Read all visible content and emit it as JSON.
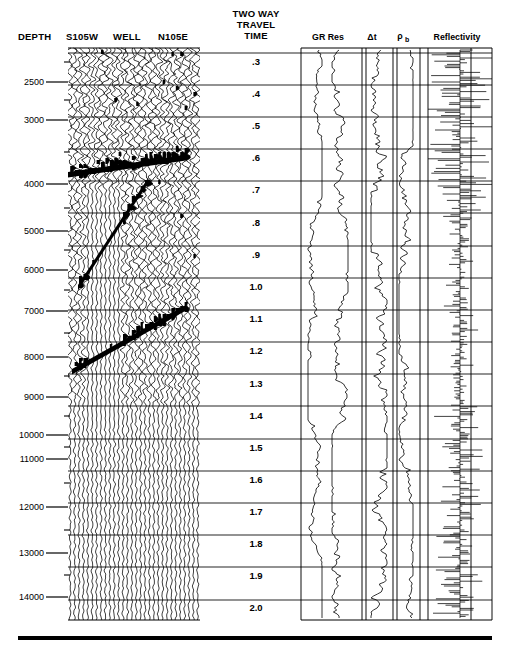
{
  "figure": {
    "type": "seismic-well-tie-display",
    "width": 509,
    "height": 655
  },
  "headers": {
    "depth": "DEPTH",
    "azimuth_left": "S105W",
    "well": "WELL",
    "azimuth_right": "N105E",
    "twt_line1": "TWO WAY",
    "twt_line2": "TRAVEL",
    "twt_line3": "TIME"
  },
  "tracks": [
    {
      "name": "gr-res",
      "label": "GR Res",
      "label_x": 328,
      "x0": 301,
      "x1": 362,
      "curves": 2
    },
    {
      "name": "delta-t",
      "label": "Δt",
      "label_x": 372,
      "x0": 366,
      "x1": 393,
      "curves": 1
    },
    {
      "name": "rho-b",
      "label": "ρ",
      "sub": "b",
      "label_x": 401,
      "x0": 393,
      "x1": 420,
      "curves": 1
    },
    {
      "name": "reflectivity",
      "label": "Reflectivity",
      "label_x": 457,
      "x0": 428,
      "x1": 492,
      "curves": 1
    }
  ],
  "depth_axis": {
    "unit": "ft",
    "label_x": 44,
    "tick_x0": 46,
    "tick_x1": 68,
    "ticks": [
      {
        "label": "2500",
        "y": 82
      },
      {
        "label": "3000",
        "y": 120
      },
      {
        "label": "4000",
        "y": 184
      },
      {
        "label": "5000",
        "y": 231
      },
      {
        "label": "6000",
        "y": 270
      },
      {
        "label": "7000",
        "y": 311
      },
      {
        "label": "8000",
        "y": 357
      },
      {
        "label": "9000",
        "y": 397
      },
      {
        "label": "10000",
        "y": 435
      },
      {
        "label": "11000",
        "y": 459
      },
      {
        "label": "12000",
        "y": 507
      },
      {
        "label": "13000",
        "y": 553
      },
      {
        "label": "14000",
        "y": 597
      }
    ]
  },
  "twt_axis": {
    "unit": "s",
    "label_x": 256,
    "line_x0": 68,
    "line_x1": 492,
    "gridlines": [
      {
        "label": ".3",
        "y_line": 53,
        "y_text": 65
      },
      {
        "label": ".4",
        "y_line": 85,
        "y_text": 97
      },
      {
        "label": ".5",
        "y_line": 117,
        "y_text": 129
      },
      {
        "label": ".6",
        "y_line": 149,
        "y_text": 161
      },
      {
        "label": ".7",
        "y_line": 181,
        "y_text": 193
      },
      {
        "label": ".8",
        "y_line": 213,
        "y_text": 226
      },
      {
        "label": ".9",
        "y_line": 246,
        "y_text": 258
      },
      {
        "label": "1.0",
        "y_line": 278,
        "y_text": 290
      },
      {
        "label": "1.1",
        "y_line": 310,
        "y_text": 322
      },
      {
        "label": "1.2",
        "y_line": 342,
        "y_text": 354
      },
      {
        "label": "1.3",
        "y_line": 374,
        "y_text": 387
      },
      {
        "label": "1.4",
        "y_line": 406,
        "y_text": 419
      },
      {
        "label": "1.5",
        "y_line": 439,
        "y_text": 451
      },
      {
        "label": "1.6",
        "y_line": 471,
        "y_text": 483
      },
      {
        "label": "1.7",
        "y_line": 503,
        "y_text": 515
      },
      {
        "label": "1.8",
        "y_line": 535,
        "y_text": 547
      },
      {
        "label": "1.9",
        "y_line": 567,
        "y_text": 579
      },
      {
        "label": "2.0",
        "y_line": 600,
        "y_text": 611
      }
    ]
  },
  "seismic_panel": {
    "x0": 68,
    "x1": 200,
    "y0": 48,
    "y1": 620,
    "trace_count": 30,
    "reflectors": [
      {
        "name": "dipping-reflector-upper",
        "x0": 68,
        "y0": 172,
        "x1": 186,
        "y1": 155
      },
      {
        "name": "dipping-reflector-lower",
        "x0": 72,
        "y0": 369,
        "x1": 186,
        "y1": 305
      },
      {
        "name": "fault-plane",
        "x0": 78,
        "y0": 285,
        "x1": 148,
        "y1": 178
      }
    ]
  },
  "baseline_bar": {
    "x0": 18,
    "x1": 492,
    "y": 638,
    "thickness": 4
  },
  "colors": {
    "ink": "#000000",
    "paper": "#ffffff",
    "grid": "#1a1a1a"
  },
  "chart_data": {
    "type": "line",
    "xlabel": "",
    "ylabel": "TWO WAY TRAVEL TIME",
    "grid": true,
    "legend": "none",
    "y_axis_primary": {
      "name": "TWO WAY TRAVEL TIME",
      "unit": "s",
      "range": [
        0.3,
        2.0
      ],
      "ticks": [
        0.3,
        0.4,
        0.5,
        0.6,
        0.7,
        0.8,
        0.9,
        1.0,
        1.1,
        1.2,
        1.3,
        1.4,
        1.5,
        1.6,
        1.7,
        1.8,
        1.9,
        2.0
      ]
    },
    "y_axis_secondary": {
      "name": "DEPTH",
      "unit": "ft",
      "range": [
        2500,
        14000
      ],
      "ticks": [
        2500,
        3000,
        4000,
        5000,
        6000,
        7000,
        8000,
        9000,
        10000,
        11000,
        12000,
        13000,
        14000
      ]
    },
    "series": [
      {
        "name": "GR Res",
        "kind": "well-log-curve",
        "track": "gr-res",
        "curves": 2
      },
      {
        "name": "Δt",
        "kind": "well-log-curve",
        "track": "delta-t",
        "curves": 1
      },
      {
        "name": "ρb",
        "kind": "well-log-curve",
        "track": "rho-b",
        "curves": 1
      },
      {
        "name": "Reflectivity",
        "kind": "spike-series",
        "track": "reflectivity",
        "curves": 1
      },
      {
        "name": "Seismic wiggle traces",
        "kind": "variable-area-wiggle",
        "track": "seismic-panel",
        "curves": 30
      }
    ]
  }
}
